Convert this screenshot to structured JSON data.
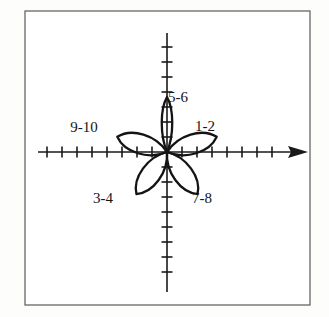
{
  "figure": {
    "kind": "polar-rose-radiation-pattern",
    "title": "",
    "frame": {
      "x": 25,
      "y": 11,
      "width": 285,
      "height": 294,
      "stroke_color": "#5a5a5a",
      "stroke_width": 1.2,
      "fill_color": "#ffffff"
    },
    "background_color": "#fdfdfc",
    "ink_color": "#151515"
  },
  "axes": {
    "origin": {
      "x": 167,
      "y": 152
    },
    "stroke_color": "#1a1a1a",
    "stroke_width": 1.6,
    "tick_length": 11,
    "tick_spacing": 15,
    "horizontal": {
      "name": "x-axis",
      "x_start": 38,
      "x_end": 300,
      "arrowhead": "right",
      "ticks_left": 8,
      "ticks_right": 8
    },
    "vertical": {
      "name": "y-axis",
      "y_start": 33,
      "y_end": 292,
      "arrowhead": "none",
      "ticks_up": 7,
      "ticks_down": 8
    }
  },
  "chart_data": {
    "type": "line",
    "subtype": "polar-rose",
    "title": "",
    "xlabel": "",
    "ylabel": "",
    "grid": false,
    "legend_position": "inline-annotations",
    "petal_count": 5,
    "petals": [
      {
        "label": "5-6",
        "name": "petal-5-6",
        "angle_deg": 90,
        "length_px": 55,
        "half_width_px": 7,
        "label_x": 178,
        "label_y": 102
      },
      {
        "label": "1-2",
        "name": "petal-1-2",
        "angle_deg": 17,
        "length_px": 52,
        "half_width_px": 13,
        "label_x": 205,
        "label_y": 131
      },
      {
        "label": "9-10",
        "name": "petal-9-10",
        "angle_deg": 163,
        "length_px": 52,
        "half_width_px": 13,
        "label_x": 84,
        "label_y": 132
      },
      {
        "label": "3-4",
        "name": "petal-3-4",
        "angle_deg": 234,
        "length_px": 52,
        "half_width_px": 13,
        "label_x": 103,
        "label_y": 203
      },
      {
        "label": "7-8",
        "name": "petal-7-8",
        "angle_deg": 306,
        "length_px": 52,
        "half_width_px": 13,
        "label_x": 202,
        "label_y": 203
      }
    ],
    "annotations": [
      "1-2",
      "3-4",
      "5-6",
      "7-8",
      "9-10"
    ]
  }
}
